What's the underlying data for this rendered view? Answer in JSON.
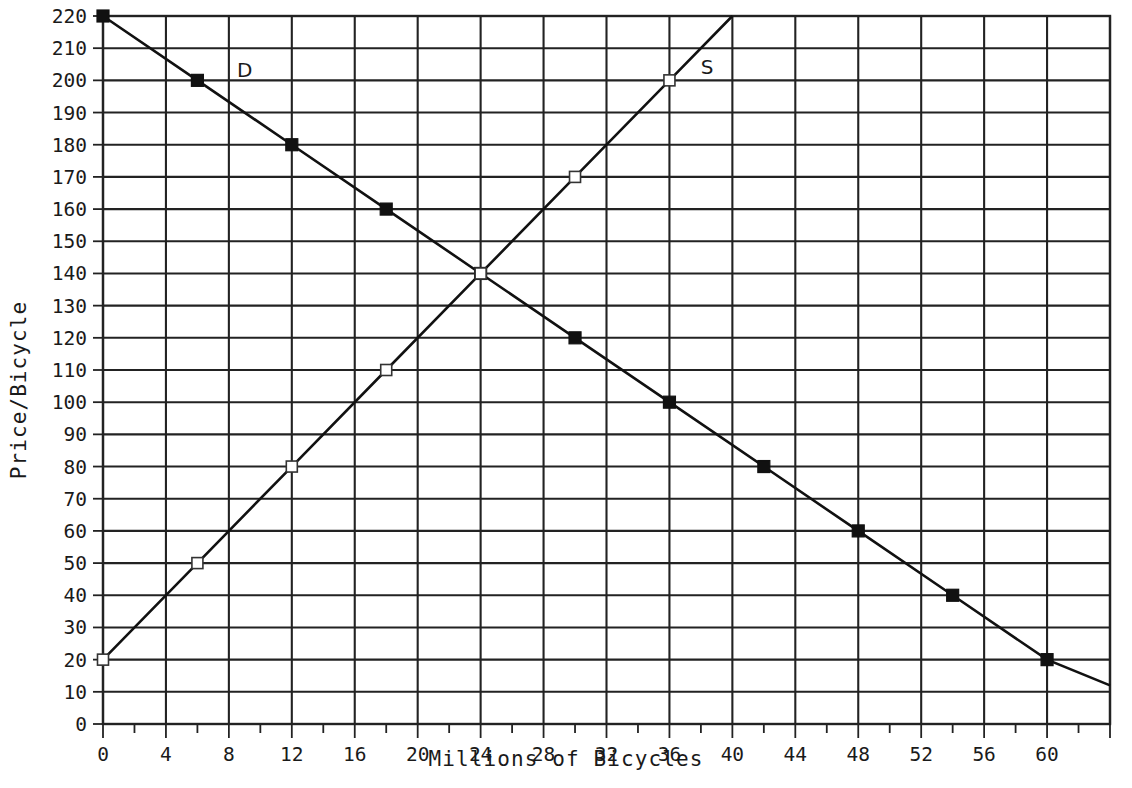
{
  "chart_data": {
    "type": "line",
    "title": "",
    "xlabel": "Millions of Bicycles",
    "ylabel": "Price/Bicycle",
    "xlim": [
      0,
      64
    ],
    "ylim": [
      0,
      220
    ],
    "grid": true,
    "legend_position": "inline-annotation",
    "x_tick_labels": [
      "0",
      "4",
      "8",
      "12",
      "16",
      "20",
      "24",
      "28",
      "32",
      "36",
      "40",
      "44",
      "48",
      "52",
      "56",
      "60"
    ],
    "x_tick_values": [
      0,
      4,
      8,
      12,
      16,
      20,
      24,
      28,
      32,
      36,
      40,
      44,
      48,
      52,
      56,
      60
    ],
    "x_minor_step": 2,
    "y_tick_labels": [
      "0",
      "10",
      "20",
      "30",
      "40",
      "50",
      "60",
      "70",
      "80",
      "90",
      "100",
      "110",
      "120",
      "130",
      "140",
      "150",
      "160",
      "170",
      "180",
      "190",
      "200",
      "210",
      "220"
    ],
    "y_tick_values": [
      0,
      10,
      20,
      30,
      40,
      50,
      60,
      70,
      80,
      90,
      100,
      110,
      120,
      130,
      140,
      150,
      160,
      170,
      180,
      190,
      200,
      210,
      220
    ],
    "y_gridline_step": 10,
    "x_gridline_step": 4,
    "series": [
      {
        "name": "D",
        "label": "D",
        "label_x": 9,
        "label_y": 201,
        "marker": "filled-square",
        "x": [
          0,
          6,
          12,
          18,
          24,
          30,
          36,
          42,
          48,
          54,
          60
        ],
        "values": [
          220,
          200,
          180,
          160,
          140,
          120,
          100,
          80,
          60,
          40,
          20
        ],
        "line_extends_to_x": 64,
        "line_extends_to_y": 12
      },
      {
        "name": "S",
        "label": "S",
        "label_x": 38.4,
        "label_y": 202,
        "marker": "open-square",
        "x": [
          0,
          6,
          12,
          18,
          24,
          30,
          36
        ],
        "values": [
          20,
          50,
          80,
          110,
          140,
          170,
          200
        ],
        "line_extends_to_x": 40,
        "line_extends_to_y": 220
      }
    ],
    "equilibrium": {
      "x": 24,
      "y": 140
    },
    "colors": {
      "background": "#ffffff",
      "grid": "#222222",
      "line": "#111111",
      "marker_fill": "#111111",
      "marker_open_fill": "#ffffff",
      "text": "#1a1a1a"
    }
  }
}
